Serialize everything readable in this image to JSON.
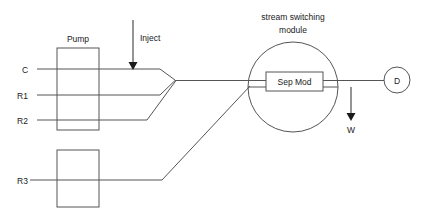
{
  "diagram": {
    "labels": {
      "pump": "Pump",
      "inject": "Inject",
      "stream_switching_line1": "stream switching",
      "stream_switching_line2": "module",
      "sep_mod": "Sep Mod",
      "detector": "D",
      "waste": "W",
      "inlet_c": "C",
      "inlet_r1": "R1",
      "inlet_r2": "R2",
      "inlet_r3": "R3"
    },
    "colors": {
      "background": "#ffffff",
      "line": "#555555",
      "arrow": "#1a1a1a",
      "text": "#1a1a1a"
    },
    "nodes": [
      {
        "id": "pump",
        "type": "rect",
        "label": "Pump",
        "x": 57,
        "y": 48,
        "w": 42,
        "h": 82
      },
      {
        "id": "r3-pump",
        "type": "rect",
        "label": "",
        "x": 57,
        "y": 150,
        "w": 42,
        "h": 57
      },
      {
        "id": "switching-module",
        "type": "circle",
        "label": "stream switching module",
        "cx": 293,
        "cy": 87,
        "r": 45
      },
      {
        "id": "sep-mod",
        "type": "rect",
        "label": "Sep Mod",
        "x": 266,
        "y": 72,
        "w": 57,
        "h": 19
      },
      {
        "id": "detector",
        "type": "circle",
        "label": "D",
        "cx": 397,
        "cy": 80,
        "r": 13
      }
    ],
    "streams": [
      {
        "id": "C",
        "label": "C",
        "y": 69
      },
      {
        "id": "R1",
        "label": "R1",
        "y": 95
      },
      {
        "id": "R2",
        "label": "R2",
        "y": 120
      },
      {
        "id": "R3",
        "label": "R3",
        "y": 180
      }
    ],
    "arrows": [
      {
        "id": "inject",
        "label": "Inject",
        "direction": "down",
        "x": 133,
        "from_y": 20,
        "to_y": 69
      },
      {
        "id": "waste",
        "label": "W",
        "direction": "down",
        "x": 351,
        "from_y": 87,
        "to_y": 120
      }
    ]
  }
}
